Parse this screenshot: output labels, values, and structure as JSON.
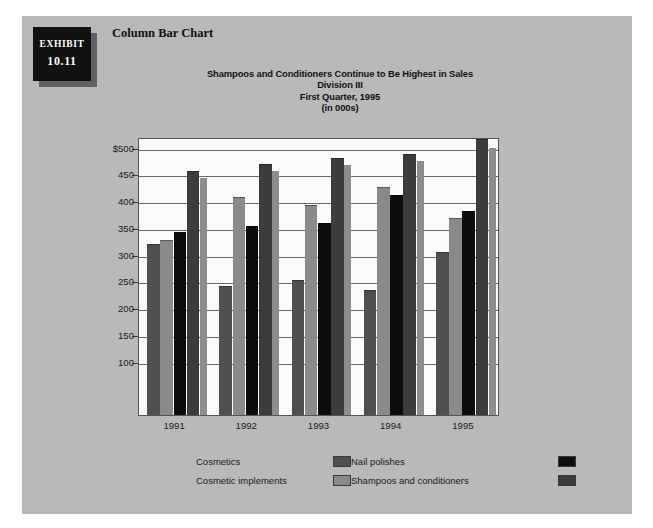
{
  "exhibit": {
    "label": "Exhibit",
    "number": "10.11",
    "caption": "Column Bar Chart"
  },
  "chart_data": {
    "type": "bar",
    "title": "Shampoos and Conditioners Continue to Be Highest in Sales",
    "subtitle": "Division III",
    "subtitle2": "First Quarter, 1995",
    "units": "(in 000s)",
    "xlabel": "",
    "ylabel": "",
    "categories": [
      "1991",
      "1992",
      "1993",
      "1994",
      "1995"
    ],
    "ylim": [
      0,
      520
    ],
    "yticks": [
      100,
      150,
      200,
      250,
      300,
      350,
      400,
      450,
      500
    ],
    "ytick_labels": [
      "100",
      "150",
      "200",
      "250",
      "300",
      "350",
      "400",
      "450",
      "$500"
    ],
    "grid": true,
    "legend_position": "bottom",
    "series": [
      {
        "name": "Cosmetics",
        "color": "#4f4f4f",
        "values": [
          320,
          242,
          252,
          234,
          305
        ]
      },
      {
        "name": "Cosmetic implements",
        "color": "#8a8a8a",
        "values": [
          327,
          408,
          392,
          426,
          368
        ]
      },
      {
        "name": "Nail polishes",
        "color": "#0d0d0d",
        "values": [
          343,
          353,
          359,
          411,
          381
        ]
      },
      {
        "name": "Shampoos and conditioners",
        "color": "#3c3c3c",
        "values": [
          457,
          470,
          481,
          489,
          516
        ]
      }
    ],
    "shadow_values": [
      443,
      456,
      467,
      475,
      500
    ]
  },
  "legend": {
    "items": [
      {
        "label": "Cosmetics",
        "color": "#4f4f4f"
      },
      {
        "label": "Nail polishes",
        "color": "#0d0d0d"
      },
      {
        "label": "Cosmetic implements",
        "color": "#8a8a8a"
      },
      {
        "label": "Shampoos and conditioners",
        "color": "#3c3c3c"
      }
    ]
  },
  "colors": {
    "page_background": "#ffffff",
    "panel_background": "#b9b9b9",
    "plot_background": "#fbfbfb",
    "gridline": "#6a6a6a",
    "badge_background": "#111111",
    "text": "#1a1a1a"
  }
}
